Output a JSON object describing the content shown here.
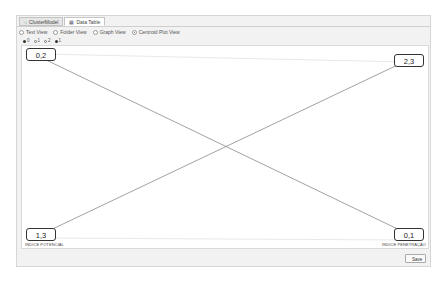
{
  "tabs": [
    {
      "label": "ClusterModel",
      "icon": "cluster-icon",
      "active": false
    },
    {
      "label": "Data Table",
      "icon": "table-icon",
      "active": true
    }
  ],
  "view_options": [
    {
      "label": "Text View",
      "selected": false
    },
    {
      "label": "Folder View",
      "selected": false
    },
    {
      "label": "Graph View",
      "selected": false
    },
    {
      "label": "Centroid Plot View",
      "selected": true
    }
  ],
  "legend": [
    {
      "label": "0",
      "style": "filled"
    },
    {
      "label": "1",
      "style": "hollow"
    },
    {
      "label": "2",
      "style": "hollow"
    },
    {
      "label": "1",
      "style": "filled"
    }
  ],
  "plot": {
    "nodes": {
      "top_left": "0,2",
      "top_right": "2,3",
      "bottom_left": "1,3",
      "bottom_right": "0,1"
    },
    "axis_labels": {
      "left": "INDICE POTENCIAL",
      "right": "INDICE PENETRAÇÃO"
    },
    "line_color": "#8a8a8a"
  },
  "footer": {
    "save_label": "Save"
  }
}
